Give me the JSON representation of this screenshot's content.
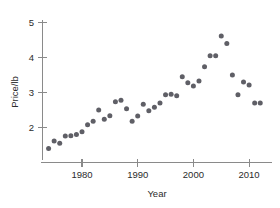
{
  "chart_data": {
    "type": "scatter",
    "title": "",
    "xlabel": "Year",
    "ylabel": "Price/lb",
    "xlim": [
      1973,
      2013
    ],
    "ylim": [
      1.1,
      5.3
    ],
    "grid": false,
    "legend": null,
    "marker_color": "#5f5f66",
    "axis_color": "#8a8a8a",
    "x_ticks": [
      1980,
      1990,
      2000,
      2010
    ],
    "x_tick_labels": [
      "1980",
      "1990",
      "2000",
      "2010"
    ],
    "y_ticks": [
      2,
      3,
      4,
      5
    ],
    "y_tick_labels": [
      "2",
      "3",
      "4",
      "5"
    ],
    "series": [
      {
        "name": "Price/lb",
        "x": [
          1974,
          1975,
          1976,
          1977,
          1978,
          1979,
          1980,
          1981,
          1982,
          1983,
          1984,
          1985,
          1986,
          1987,
          1988,
          1989,
          1990,
          1991,
          1992,
          1993,
          1994,
          1995,
          1996,
          1997,
          1998,
          1999,
          2000,
          2001,
          2002,
          2003,
          2004,
          2005,
          2006,
          2007,
          2008,
          2009,
          2010,
          2011,
          2012
        ],
        "y": [
          1.4,
          1.62,
          1.55,
          1.76,
          1.77,
          1.8,
          1.88,
          2.08,
          2.18,
          2.5,
          2.24,
          2.34,
          2.74,
          2.78,
          2.54,
          2.18,
          2.33,
          2.67,
          2.48,
          2.58,
          2.7,
          2.94,
          2.95,
          2.91,
          3.45,
          3.28,
          3.19,
          3.33,
          3.74,
          4.05,
          4.05,
          4.62,
          4.4,
          3.5,
          2.94,
          3.3,
          3.22,
          2.7,
          2.7
        ]
      }
    ]
  },
  "axes": {
    "x_title": "Year",
    "y_title": "Price/lb"
  }
}
